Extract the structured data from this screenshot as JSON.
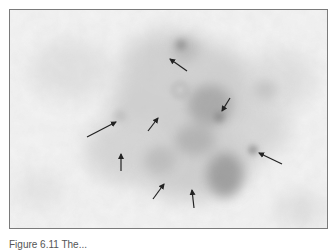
{
  "figure": {
    "type": "grayscale micrograph",
    "arrow_count": 8,
    "arrows": [
      {
        "id": 1,
        "x1": 177,
        "y1": 61,
        "x2": 160,
        "y2": 49
      },
      {
        "id": 2,
        "x1": 220,
        "y1": 88,
        "x2": 212,
        "y2": 101
      },
      {
        "id": 3,
        "x1": 272,
        "y1": 154,
        "x2": 249,
        "y2": 143
      },
      {
        "id": 4,
        "x1": 77,
        "y1": 127,
        "x2": 106,
        "y2": 112
      },
      {
        "id": 5,
        "x1": 138,
        "y1": 121,
        "x2": 148,
        "y2": 108
      },
      {
        "id": 6,
        "x1": 111,
        "y1": 161,
        "x2": 111,
        "y2": 144
      },
      {
        "id": 7,
        "x1": 143,
        "y1": 189,
        "x2": 154,
        "y2": 174
      },
      {
        "id": 8,
        "x1": 184,
        "y1": 198,
        "x2": 182,
        "y2": 180
      }
    ],
    "colors": {
      "background": "#f2f2f2",
      "tissue_dark": "#8c8c8c",
      "tissue_mid": "#bdbdbd",
      "arrow": "#222222",
      "border": "#7a7a7a"
    }
  },
  "caption": {
    "text": "Figure 6.11  The..."
  }
}
